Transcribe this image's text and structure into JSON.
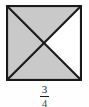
{
  "figure": {
    "name": "square-divided-by-diagonals",
    "background_color": "#fefefe"
  },
  "shape": {
    "type": "square",
    "stroke_color": "#1a1a1a",
    "stroke_width": 2,
    "shaded_color": "#c9c9c9",
    "unshaded_color": "#ffffff",
    "total_parts": 4,
    "shaded_parts": 3,
    "regions": [
      {
        "id": "top-triangle",
        "position": "top",
        "shaded": true,
        "fill": "#c9c9c9"
      },
      {
        "id": "left-triangle",
        "position": "left",
        "shaded": true,
        "fill": "#c9c9c9"
      },
      {
        "id": "bottom-triangle",
        "position": "bottom",
        "shaded": true,
        "fill": "#c9c9c9"
      },
      {
        "id": "right-triangle",
        "position": "right",
        "shaded": false,
        "fill": "#ffffff"
      }
    ],
    "diagonals": [
      {
        "id": "diagonal-tl-br",
        "from": "top-left",
        "to": "bottom-right"
      },
      {
        "id": "diagonal-tr-bl",
        "from": "top-right",
        "to": "bottom-left"
      }
    ]
  },
  "caption": {
    "fraction": "3/4",
    "numerator": "3",
    "denominator": "4"
  }
}
